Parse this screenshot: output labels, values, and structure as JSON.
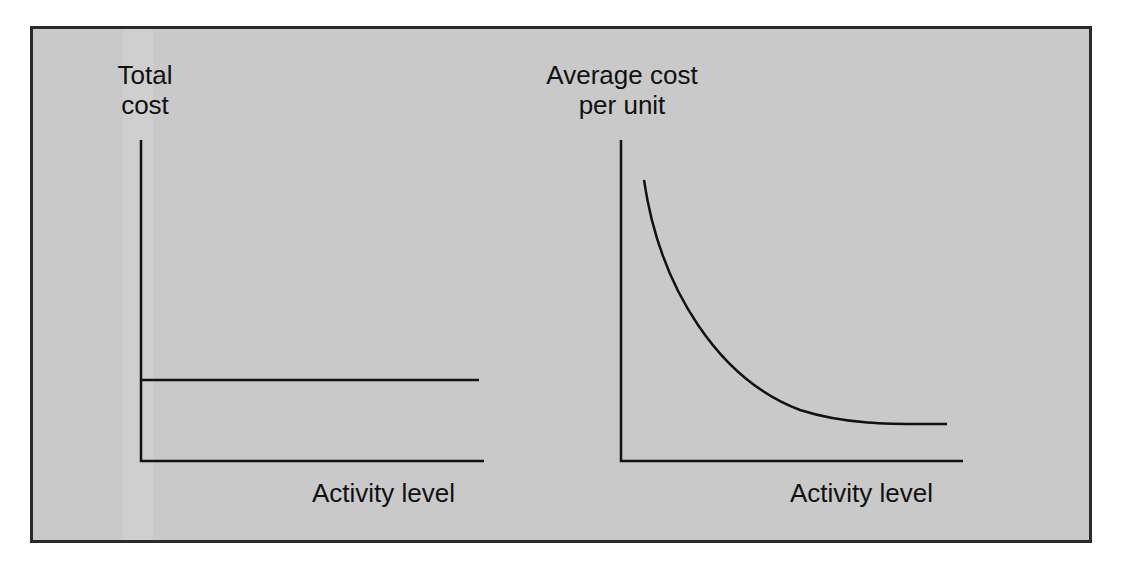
{
  "panels": [
    {
      "y_label_line1": "Total",
      "y_label_line2": "cost",
      "x_label": "Activity level",
      "curve": "horizontal line (constant total cost)"
    },
    {
      "y_label_line1": "Average cost",
      "y_label_line2": "per unit",
      "x_label": "Activity level",
      "curve": "decreasing convex curve (average cost falls as activity rises)"
    }
  ],
  "colors": {
    "background": "#c9c9c9",
    "line": "#111111",
    "frame": "#2a2a2a"
  }
}
